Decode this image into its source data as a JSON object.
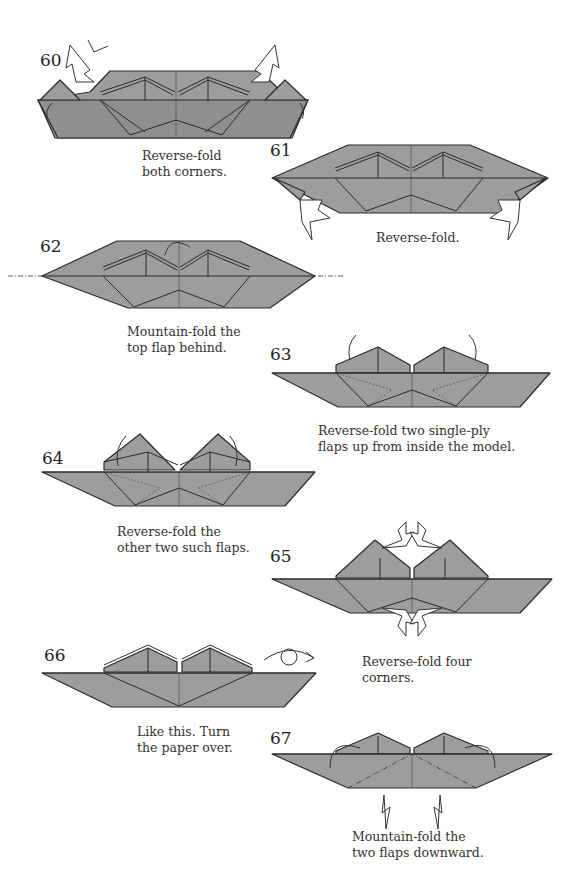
{
  "page": {
    "steps": [
      {
        "number": "60",
        "caption": [
          "Reverse-fold",
          "both corners."
        ]
      },
      {
        "number": "61",
        "caption": [
          "Reverse-fold."
        ]
      },
      {
        "number": "62",
        "caption": [
          "Mountain-fold the",
          "top flap behind."
        ]
      },
      {
        "number": "63",
        "caption": [
          "Reverse-fold two single-ply",
          "flaps up from inside the model."
        ]
      },
      {
        "number": "64",
        "caption": [
          "Reverse-fold the",
          "other two such flaps."
        ]
      },
      {
        "number": "65",
        "caption": [
          "Reverse-fold four",
          "corners."
        ]
      },
      {
        "number": "66",
        "caption": [
          "Like this. Turn",
          "the paper over."
        ]
      },
      {
        "number": "67",
        "caption": [
          "Mountain-fold the",
          "two flaps downward."
        ]
      }
    ],
    "colors": {
      "paper": "#9d9d9d",
      "line": "#2b2b2b",
      "background": "#ffffff"
    },
    "icons": {
      "reverse_fold_arrow": "hollow-push-arrow",
      "fold_behind_arrow": "curved-arrow",
      "turn_over": "turn-over-loop-arrow",
      "mountain_fold_line": "dash-dot-line"
    }
  }
}
